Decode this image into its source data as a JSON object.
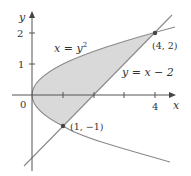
{
  "figure": {
    "type": "region-between-curves",
    "curves": [
      {
        "id": "parabola",
        "equation": "x = y^2",
        "label": "x = y²"
      },
      {
        "id": "line",
        "equation": "y = x − 2",
        "label": "y = x − 2"
      }
    ],
    "intersection_points": [
      {
        "label": "(1, −1)",
        "x": 1,
        "y": -1
      },
      {
        "label": "(4, 2)",
        "x": 4,
        "y": 2
      }
    ],
    "shaded_region": "region enclosed between x = y² and y = x − 2",
    "axes": {
      "x_label": "x",
      "y_label": "y",
      "origin_label": "0",
      "x_ticks": [
        {
          "value": 1,
          "label": ""
        },
        {
          "value": 2,
          "label": ""
        },
        {
          "value": 3,
          "label": ""
        },
        {
          "value": 4,
          "label": "4"
        }
      ],
      "y_ticks": [
        {
          "value": 1,
          "label": "1"
        },
        {
          "value": 2,
          "label": "2"
        }
      ]
    }
  },
  "colors": {
    "shade": "#d9d9d9",
    "curve": "#8a8a8a",
    "axis": "#555555",
    "point": "#444444",
    "text": "#333333"
  },
  "labels": {
    "parabola": "x = y",
    "parabola_exp": "2",
    "line": "y = x − 2",
    "point_a": "(4, 2)",
    "point_b": "(1, −1)",
    "x_axis": "x",
    "y_axis": "y",
    "origin": "0",
    "x_tick_4": "4",
    "y_tick_1": "1",
    "y_tick_2": "2"
  }
}
